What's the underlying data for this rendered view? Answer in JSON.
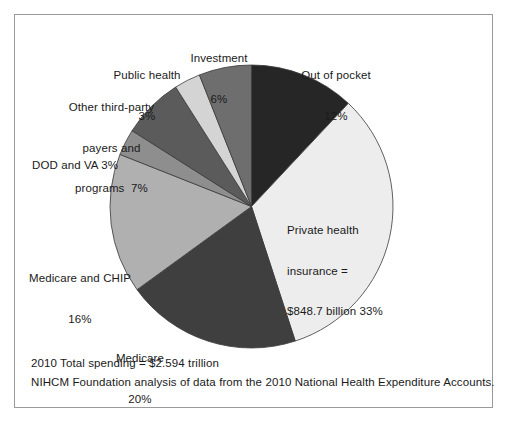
{
  "figure": {
    "border_color": "#9a9a9a",
    "background": "#ffffff"
  },
  "chart_data": {
    "type": "pie",
    "title": "",
    "subtitle": "",
    "xlabel": "",
    "ylabel": "",
    "legend": "none",
    "start_angle_deg": 0,
    "direction": "clockwise",
    "total_label": "2010 Total spending = $2.594 trillion",
    "source_note": "NIHCM Foundation analysis of data from the 2010 National Health Expenditure Accounts.",
    "categories": [
      "Out of pocket",
      "Private health insurance",
      "Medicare",
      "Medicare and CHIP",
      "DOD and VA",
      "Other third-party payers and programs",
      "Public health",
      "Investment"
    ],
    "values": [
      12,
      33,
      20,
      16,
      3,
      7,
      3,
      6
    ],
    "value_unit": "percent",
    "colors": [
      "#262626",
      "#ededed",
      "#3f3f3f",
      "#b0b0b0",
      "#8e8e8e",
      "#5b5b5b",
      "#d4d4d4",
      "#6e6e6e"
    ],
    "slices": [
      {
        "name": "out-of-pocket",
        "label_line1": "Out of pocket",
        "label_line2": "12%",
        "value": 12,
        "color": "#262626",
        "start_deg": 0,
        "end_deg": 43.2
      },
      {
        "name": "private-health-insurance",
        "label_line1": "Private health",
        "label_line2": "insurance =",
        "label_line3": "$848.7 billion 33%",
        "value": 33,
        "amount": "$848.7 billion",
        "color": "#ededed",
        "start_deg": 43.2,
        "end_deg": 162.0
      },
      {
        "name": "medicare",
        "label_line1": "Medicare",
        "label_line2": "20%",
        "value": 20,
        "color": "#3f3f3f",
        "start_deg": 162.0,
        "end_deg": 234.0
      },
      {
        "name": "medicare-and-chip",
        "label_line1": "Medicare and CHIP",
        "label_line2": "16%",
        "value": 16,
        "color": "#b0b0b0",
        "start_deg": 234.0,
        "end_deg": 291.6
      },
      {
        "name": "dod-and-va",
        "label_line1": "DOD and VA 3%",
        "value": 3,
        "color": "#8e8e8e",
        "start_deg": 291.6,
        "end_deg": 302.4
      },
      {
        "name": "other-third-party-payers",
        "label_line1": "Other third-party",
        "label_line2": "payers and",
        "label_line3": "programs  7%",
        "value": 7,
        "color": "#5b5b5b",
        "start_deg": 302.4,
        "end_deg": 327.6
      },
      {
        "name": "public-health",
        "label_line1": "Public health",
        "label_line2": "3%",
        "value": 3,
        "color": "#d4d4d4",
        "start_deg": 327.6,
        "end_deg": 338.4
      },
      {
        "name": "investment",
        "label_line1": "Investment",
        "label_line2": "6%",
        "value": 6,
        "color": "#6e6e6e",
        "start_deg": 338.4,
        "end_deg": 360.0
      }
    ]
  },
  "labels": {
    "investment": {
      "line1": "Investment",
      "line2": "6%"
    },
    "public_health": {
      "line1": "Public health",
      "line2": "3%"
    },
    "other_third_party": {
      "line1": "Other third-party",
      "line2": "payers and",
      "line3": "programs  7%"
    },
    "dod_and_va": {
      "line1": "DOD and VA 3%"
    },
    "medicare_and_chip": {
      "line1": "Medicare and CHIP",
      "line2": "16%"
    },
    "medicare": {
      "line1": "Medicare",
      "line2": "20%"
    },
    "out_of_pocket": {
      "line1": "Out of pocket",
      "line2": "12%"
    },
    "private_health_insurance": {
      "line1": "Private health",
      "line2": "insurance =",
      "line3": "$848.7 billion 33%"
    }
  },
  "footer": {
    "total": "2010 Total spending = $2.594 trillion",
    "source": "NIHCM Foundation analysis of data from the 2010 National Health Expenditure Accounts."
  }
}
